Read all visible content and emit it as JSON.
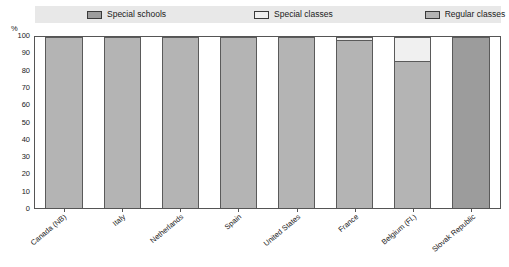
{
  "chart_data": {
    "type": "bar",
    "subtype": "stacked-100-percent",
    "title": "",
    "xlabel": "",
    "ylabel": "%",
    "ylim": [
      0,
      100
    ],
    "ytick_step": 10,
    "yticks": [
      100,
      90,
      80,
      70,
      60,
      50,
      40,
      30,
      20,
      10,
      0
    ],
    "grid": false,
    "legend_position": "top",
    "categories": [
      "Canada (NB)",
      "Italy",
      "Netherlands",
      "Spain",
      "United States",
      "France",
      "Belgium (Fl.)",
      "Slovak Republic"
    ],
    "series": [
      {
        "name": "Special schools",
        "color": "#9c9c9c",
        "values": [
          0,
          0,
          0,
          0,
          0,
          0,
          0,
          100
        ]
      },
      {
        "name": "Special classes",
        "color": "#f0f0f0",
        "values": [
          0,
          0,
          0,
          0,
          0,
          2,
          14,
          0
        ]
      },
      {
        "name": "Regular classes",
        "color": "#b4b4b4",
        "values": [
          100,
          100,
          100,
          100,
          100,
          98,
          86,
          0
        ]
      }
    ]
  },
  "legend": {
    "items": [
      {
        "label": "Special schools",
        "color": "#9c9c9c"
      },
      {
        "label": "Special classes",
        "color": "#f0f0f0"
      },
      {
        "label": "Regular classes",
        "color": "#b4b4b4"
      }
    ]
  },
  "axis": {
    "y_unit": "%",
    "y_labels": [
      "100",
      "90",
      "80",
      "70",
      "60",
      "50",
      "40",
      "30",
      "20",
      "10",
      "0"
    ]
  },
  "footer": {
    "note": ""
  }
}
